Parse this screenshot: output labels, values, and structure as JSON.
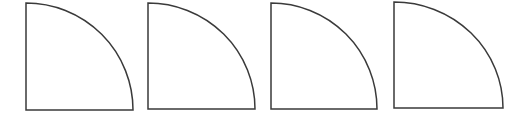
{
  "figure": {
    "width": 530,
    "height": 115,
    "background": "#ffffff",
    "stroke_color": "#3a3a3a",
    "fill_color": "#ffffff",
    "stroke_width": 1.5,
    "shapes": [
      {
        "type": "quarter-circle",
        "corner": "bottom-left",
        "x": 26,
        "y": 3,
        "width": 107,
        "height": 107
      },
      {
        "type": "quarter-circle",
        "corner": "bottom-left",
        "x": 148,
        "y": 3,
        "width": 107,
        "height": 106
      },
      {
        "type": "quarter-circle",
        "corner": "bottom-left",
        "x": 271,
        "y": 3,
        "width": 106,
        "height": 106
      },
      {
        "type": "quarter-circle",
        "corner": "bottom-left",
        "x": 394,
        "y": 2,
        "width": 109,
        "height": 106
      }
    ]
  }
}
